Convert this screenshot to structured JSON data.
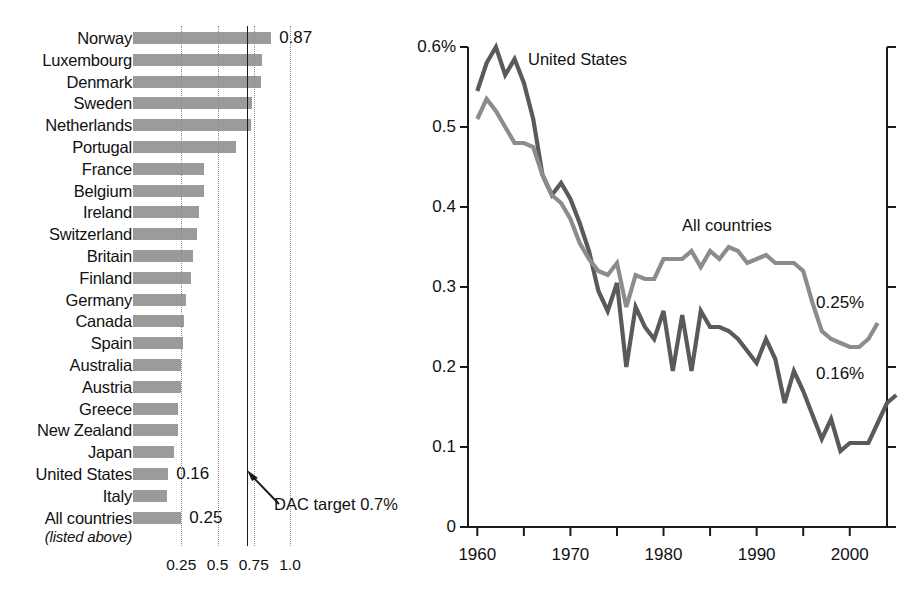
{
  "chart_data": [
    {
      "type": "bar",
      "title": "",
      "orientation": "horizontal",
      "xlabel": "",
      "ylabel": "",
      "xlim": [
        0,
        1.08
      ],
      "grid": "dotted vertical gridlines at 0.25, 0.5, 0.75, 1.0",
      "tick_labels": [
        "0.25",
        "0.5",
        "0.75",
        "1.0"
      ],
      "tick_values": [
        0.25,
        0.5,
        0.75,
        1.0
      ],
      "reference_line": {
        "value": 0.7,
        "label": "DAC target 0.7%"
      },
      "categories": [
        "Norway",
        "Luxembourg",
        "Denmark",
        "Sweden",
        "Netherlands",
        "Portugal",
        "France",
        "Belgium",
        "Ireland",
        "Switzerland",
        "Britain",
        "Finland",
        "Germany",
        "Canada",
        "Spain",
        "Australia",
        "Austria",
        "Greece",
        "New Zealand",
        "Japan",
        "United States",
        "Italy",
        "All countries"
      ],
      "category_sublabels": {
        "All countries": "(listed above)"
      },
      "values": [
        0.87,
        0.81,
        0.8,
        0.74,
        0.73,
        0.63,
        0.41,
        0.41,
        0.37,
        0.36,
        0.33,
        0.32,
        0.28,
        0.27,
        0.26,
        0.25,
        0.25,
        0.23,
        0.23,
        0.2,
        0.16,
        0.15,
        0.25
      ],
      "data_labels": [
        {
          "category": "Norway",
          "text": "0.87"
        },
        {
          "category": "United States",
          "text": "0.16"
        },
        {
          "category": "All countries",
          "text": "0.25"
        }
      ],
      "bar_color": "#9b9b9b"
    },
    {
      "type": "line",
      "title": "",
      "xlabel": "",
      "ylabel": "",
      "xlim": [
        1958,
        2005
      ],
      "ylim": [
        0,
        0.62
      ],
      "y_tick_labels": [
        "0",
        "0.1",
        "0.2",
        "0.3",
        "0.4",
        "0.5",
        "0.6%"
      ],
      "y_tick_values": [
        0,
        0.1,
        0.2,
        0.3,
        0.4,
        0.5,
        0.6
      ],
      "x_tick_labels": [
        "1960",
        "1970",
        "1980",
        "1990",
        "2000"
      ],
      "x_tick_values": [
        1960,
        1970,
        1980,
        1990,
        2000
      ],
      "x_minor_step": 5,
      "grid": "none",
      "legend": "inline series labels",
      "end_labels": [
        {
          "series": "All countries",
          "text": "0.25%"
        },
        {
          "series": "United States",
          "text": "0.16%"
        }
      ],
      "series": [
        {
          "name": "United States",
          "color": "#5a5a5a",
          "x": [
            1960,
            1961,
            1962,
            1963,
            1964,
            1965,
            1966,
            1967,
            1968,
            1969,
            1970,
            1971,
            1972,
            1973,
            1974,
            1975,
            1976,
            1977,
            1978,
            1979,
            1980,
            1981,
            1982,
            1983,
            1984,
            1985,
            1986,
            1987,
            1988,
            1989,
            1990,
            1991,
            1992,
            1993,
            1994,
            1995,
            1996,
            1997,
            1998,
            1999,
            2000,
            2001,
            2002,
            2003
          ],
          "values": [
            0.545,
            0.58,
            0.6,
            0.565,
            0.585,
            0.555,
            0.51,
            0.44,
            0.415,
            0.43,
            0.41,
            0.38,
            0.345,
            0.295,
            0.27,
            0.305,
            0.2,
            0.275,
            0.25,
            0.235,
            0.27,
            0.195,
            0.265,
            0.195,
            0.27,
            0.25,
            0.25,
            0.245,
            0.235,
            0.22,
            0.205,
            0.235,
            0.21,
            0.155,
            0.195,
            0.17,
            0.14,
            0.11,
            0.135,
            0.095,
            0.105,
            0.105,
            0.105,
            0.13,
            0.155,
            0.165
          ]
        },
        {
          "name": "All countries",
          "color": "#8c8c8c",
          "x": [
            1960,
            1961,
            1962,
            1963,
            1964,
            1965,
            1966,
            1967,
            1968,
            1969,
            1970,
            1971,
            1972,
            1973,
            1974,
            1975,
            1976,
            1977,
            1978,
            1979,
            1980,
            1981,
            1982,
            1983,
            1984,
            1985,
            1986,
            1987,
            1988,
            1989,
            1990,
            1991,
            1992,
            1993,
            1994,
            1995,
            1996,
            1997,
            1998,
            1999,
            2000,
            2001,
            2002,
            2003
          ],
          "values": [
            0.51,
            0.535,
            0.52,
            0.5,
            0.48,
            0.48,
            0.475,
            0.44,
            0.415,
            0.405,
            0.385,
            0.355,
            0.335,
            0.32,
            0.315,
            0.33,
            0.275,
            0.315,
            0.31,
            0.31,
            0.335,
            0.335,
            0.335,
            0.345,
            0.325,
            0.345,
            0.335,
            0.35,
            0.345,
            0.33,
            0.335,
            0.34,
            0.33,
            0.33,
            0.33,
            0.32,
            0.28,
            0.245,
            0.235,
            0.23,
            0.225,
            0.225,
            0.235,
            0.255
          ]
        }
      ]
    }
  ],
  "bar_chart": {
    "axis_ticks": [
      "0.25",
      "0.5",
      "0.75",
      "1.0"
    ],
    "dac_annotation": "DAC target 0.7%",
    "rows": [
      {
        "label": "Norway",
        "value": 0.87,
        "value_label": "0.87"
      },
      {
        "label": "Luxembourg",
        "value": 0.81,
        "value_label": ""
      },
      {
        "label": "Denmark",
        "value": 0.8,
        "value_label": ""
      },
      {
        "label": "Sweden",
        "value": 0.74,
        "value_label": ""
      },
      {
        "label": "Netherlands",
        "value": 0.73,
        "value_label": ""
      },
      {
        "label": "Portugal",
        "value": 0.63,
        "value_label": ""
      },
      {
        "label": "France",
        "value": 0.41,
        "value_label": ""
      },
      {
        "label": "Belgium",
        "value": 0.41,
        "value_label": ""
      },
      {
        "label": "Ireland",
        "value": 0.37,
        "value_label": ""
      },
      {
        "label": "Switzerland",
        "value": 0.36,
        "value_label": ""
      },
      {
        "label": "Britain",
        "value": 0.33,
        "value_label": ""
      },
      {
        "label": "Finland",
        "value": 0.32,
        "value_label": ""
      },
      {
        "label": "Germany",
        "value": 0.28,
        "value_label": ""
      },
      {
        "label": "Canada",
        "value": 0.27,
        "value_label": ""
      },
      {
        "label": "Spain",
        "value": 0.26,
        "value_label": ""
      },
      {
        "label": "Australia",
        "value": 0.25,
        "value_label": ""
      },
      {
        "label": "Austria",
        "value": 0.25,
        "value_label": ""
      },
      {
        "label": "Greece",
        "value": 0.23,
        "value_label": ""
      },
      {
        "label": "New Zealand",
        "value": 0.23,
        "value_label": ""
      },
      {
        "label": "Japan",
        "value": 0.2,
        "value_label": ""
      },
      {
        "label": "United States",
        "value": 0.16,
        "value_label": "0.16"
      },
      {
        "label": "Italy",
        "value": 0.15,
        "value_label": ""
      },
      {
        "label": "All countries",
        "value": 0.25,
        "value_label": "0.25",
        "sublabel": "(listed above)"
      }
    ]
  },
  "line_chart": {
    "y_ticks": [
      "0.6%",
      "0.5",
      "0.4",
      "0.3",
      "0.2",
      "0.1",
      "0"
    ],
    "x_ticks": [
      "1960",
      "1970",
      "1980",
      "1990",
      "2000"
    ],
    "series_labels": {
      "united_states": "United States",
      "all_countries": "All countries"
    },
    "end_labels": {
      "all_countries": "0.25%",
      "united_states": "0.16%"
    }
  },
  "colors": {
    "bar": "#9b9b9b",
    "us_line": "#5a5a5a",
    "all_line": "#8c8c8c",
    "axis": "#1a1a1a",
    "grid": "#8e8e8e"
  }
}
